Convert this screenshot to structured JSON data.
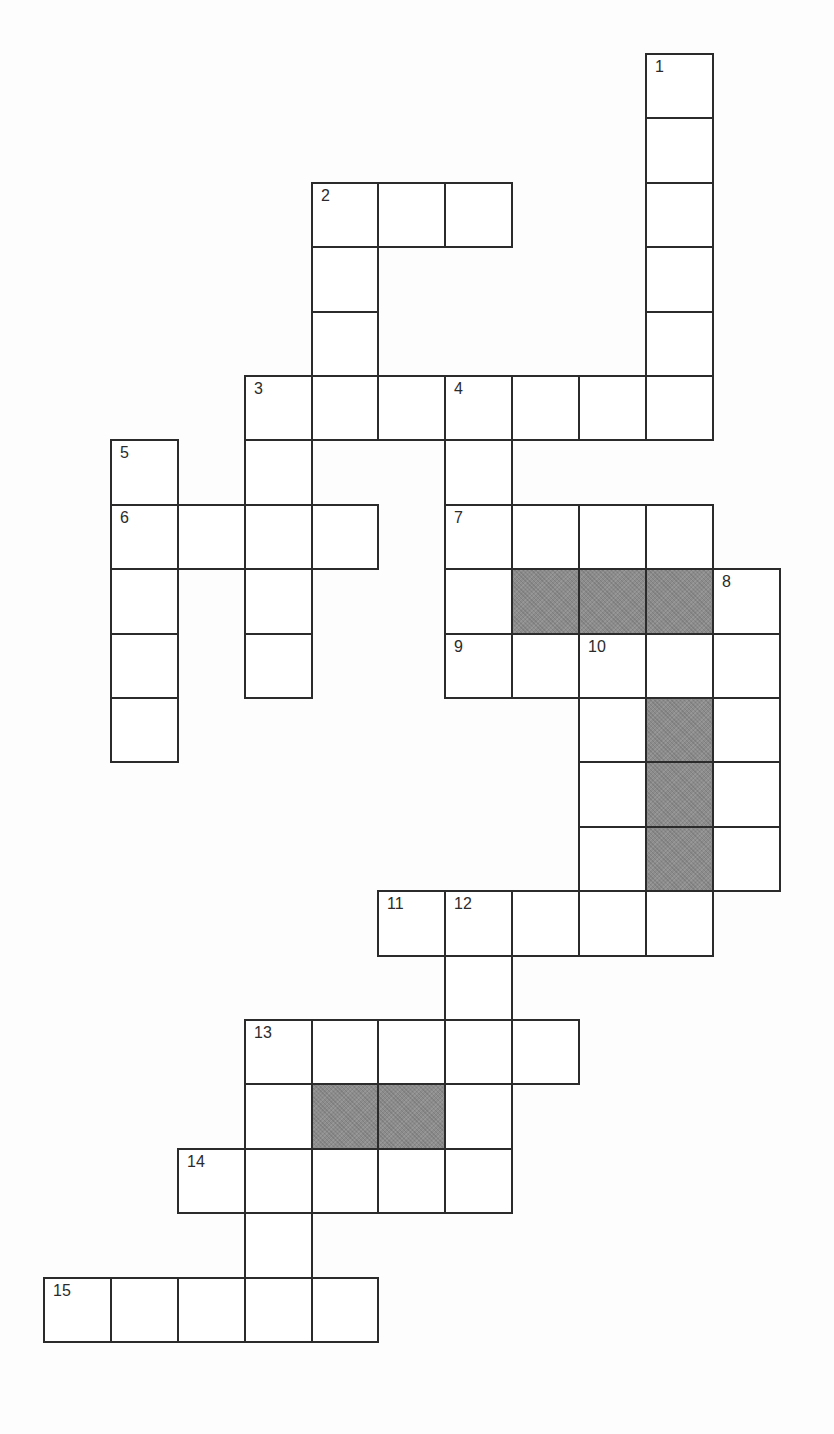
{
  "puzzle": {
    "type": "crossword",
    "grid_geometry": {
      "col_edges": [
        44,
        111,
        178,
        245,
        312,
        378,
        445,
        512,
        579,
        646,
        713,
        780
      ],
      "row_edges": [
        54,
        118,
        183,
        247,
        312,
        376,
        440,
        505,
        569,
        634,
        698,
        762,
        827,
        891,
        956,
        1020,
        1084,
        1149,
        1213,
        1278,
        1342
      ]
    },
    "colors": {
      "line": "#2b2b2b",
      "cell_fill": "#ffffff",
      "block_fill": "#8c8c8c",
      "background": "#fdfdfd"
    },
    "entries": [
      {
        "number": "1",
        "direction": "down",
        "row": 0,
        "col": 9,
        "length": 6
      },
      {
        "number": "2",
        "direction": "across",
        "row": 2,
        "col": 4,
        "length": 3
      },
      {
        "number": "2",
        "direction": "down",
        "row": 2,
        "col": 4,
        "length": 4
      },
      {
        "number": "3",
        "direction": "across",
        "row": 5,
        "col": 3,
        "length": 7
      },
      {
        "number": "3",
        "direction": "down",
        "row": 5,
        "col": 3,
        "length": 5
      },
      {
        "number": "4",
        "direction": "down",
        "row": 5,
        "col": 6,
        "length": 5
      },
      {
        "number": "5",
        "direction": "down",
        "row": 6,
        "col": 1,
        "length": 5
      },
      {
        "number": "6",
        "direction": "across",
        "row": 7,
        "col": 1,
        "length": 4
      },
      {
        "number": "7",
        "direction": "across",
        "row": 7,
        "col": 6,
        "length": 4
      },
      {
        "number": "8",
        "direction": "down",
        "row": 8,
        "col": 10,
        "length": 5
      },
      {
        "number": "9",
        "direction": "across",
        "row": 9,
        "col": 6,
        "length": 5
      },
      {
        "number": "10",
        "direction": "down",
        "row": 9,
        "col": 8,
        "length": 5
      },
      {
        "number": "11",
        "direction": "across",
        "row": 13,
        "col": 5,
        "length": 5
      },
      {
        "number": "12",
        "direction": "down",
        "row": 13,
        "col": 6,
        "length": 5
      },
      {
        "number": "13",
        "direction": "across",
        "row": 15,
        "col": 3,
        "length": 5
      },
      {
        "number": "13",
        "direction": "down",
        "row": 15,
        "col": 3,
        "length": 5
      },
      {
        "number": "14",
        "direction": "across",
        "row": 17,
        "col": 2,
        "length": 5
      },
      {
        "number": "15",
        "direction": "across",
        "row": 19,
        "col": 0,
        "length": 5
      }
    ],
    "cells": [
      {
        "r": 0,
        "c": 9,
        "label": "1"
      },
      {
        "r": 1,
        "c": 9
      },
      {
        "r": 2,
        "c": 4,
        "label": "2"
      },
      {
        "r": 2,
        "c": 5
      },
      {
        "r": 2,
        "c": 6
      },
      {
        "r": 2,
        "c": 9
      },
      {
        "r": 3,
        "c": 4
      },
      {
        "r": 3,
        "c": 9
      },
      {
        "r": 4,
        "c": 4
      },
      {
        "r": 4,
        "c": 9
      },
      {
        "r": 5,
        "c": 3,
        "label": "3"
      },
      {
        "r": 5,
        "c": 4
      },
      {
        "r": 5,
        "c": 5
      },
      {
        "r": 5,
        "c": 6,
        "label": "4"
      },
      {
        "r": 5,
        "c": 7
      },
      {
        "r": 5,
        "c": 8
      },
      {
        "r": 5,
        "c": 9
      },
      {
        "r": 6,
        "c": 1,
        "label": "5"
      },
      {
        "r": 6,
        "c": 3
      },
      {
        "r": 6,
        "c": 6
      },
      {
        "r": 7,
        "c": 1,
        "label": "6"
      },
      {
        "r": 7,
        "c": 2
      },
      {
        "r": 7,
        "c": 3
      },
      {
        "r": 7,
        "c": 4
      },
      {
        "r": 7,
        "c": 6,
        "label": "7"
      },
      {
        "r": 7,
        "c": 7
      },
      {
        "r": 7,
        "c": 8
      },
      {
        "r": 7,
        "c": 9
      },
      {
        "r": 8,
        "c": 1
      },
      {
        "r": 8,
        "c": 3
      },
      {
        "r": 8,
        "c": 6
      },
      {
        "r": 8,
        "c": 7,
        "block": true
      },
      {
        "r": 8,
        "c": 8,
        "block": true
      },
      {
        "r": 8,
        "c": 9,
        "block": true
      },
      {
        "r": 8,
        "c": 10,
        "label": "8"
      },
      {
        "r": 9,
        "c": 1
      },
      {
        "r": 9,
        "c": 3
      },
      {
        "r": 9,
        "c": 6,
        "label": "9"
      },
      {
        "r": 9,
        "c": 7
      },
      {
        "r": 9,
        "c": 8,
        "label": "10"
      },
      {
        "r": 9,
        "c": 9
      },
      {
        "r": 9,
        "c": 10
      },
      {
        "r": 10,
        "c": 1
      },
      {
        "r": 10,
        "c": 8
      },
      {
        "r": 10,
        "c": 9,
        "block": true
      },
      {
        "r": 10,
        "c": 10
      },
      {
        "r": 11,
        "c": 8
      },
      {
        "r": 11,
        "c": 9,
        "block": true
      },
      {
        "r": 11,
        "c": 10
      },
      {
        "r": 12,
        "c": 8
      },
      {
        "r": 12,
        "c": 9,
        "block": true
      },
      {
        "r": 12,
        "c": 10
      },
      {
        "r": 13,
        "c": 5,
        "label": "11"
      },
      {
        "r": 13,
        "c": 6,
        "label": "12"
      },
      {
        "r": 13,
        "c": 7
      },
      {
        "r": 13,
        "c": 8
      },
      {
        "r": 13,
        "c": 9
      },
      {
        "r": 14,
        "c": 6
      },
      {
        "r": 15,
        "c": 3,
        "label": "13"
      },
      {
        "r": 15,
        "c": 4
      },
      {
        "r": 15,
        "c": 5
      },
      {
        "r": 15,
        "c": 6
      },
      {
        "r": 15,
        "c": 7
      },
      {
        "r": 16,
        "c": 3
      },
      {
        "r": 16,
        "c": 4,
        "block": true
      },
      {
        "r": 16,
        "c": 5,
        "block": true
      },
      {
        "r": 16,
        "c": 6
      },
      {
        "r": 17,
        "c": 2,
        "label": "14"
      },
      {
        "r": 17,
        "c": 3
      },
      {
        "r": 17,
        "c": 4
      },
      {
        "r": 17,
        "c": 5
      },
      {
        "r": 17,
        "c": 6
      },
      {
        "r": 18,
        "c": 3
      },
      {
        "r": 19,
        "c": 0,
        "label": "15"
      },
      {
        "r": 19,
        "c": 1
      },
      {
        "r": 19,
        "c": 2
      },
      {
        "r": 19,
        "c": 3
      },
      {
        "r": 19,
        "c": 4
      }
    ]
  }
}
